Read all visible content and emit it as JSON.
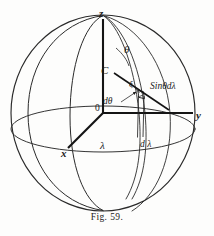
{
  "figure": {
    "caption_prefix": "F",
    "caption_smallcaps": "IG.",
    "caption_number": "59.",
    "caption_full": "Fig. 59.",
    "ink_color": "#1b1b1b",
    "background_color": "#fdfdfc"
  },
  "labels": {
    "axis_z": "z",
    "axis_y": "y",
    "axis_x": "x",
    "origin": "0",
    "point_c": "C",
    "theta": "θ",
    "d_theta": "dθ",
    "xi": "ξ",
    "lambda": "λ",
    "d_lambda": "d λ",
    "sin_theta_d_lambda": "Sinθdλ"
  },
  "geometry": {
    "sphere_center": [
      103,
      113
    ],
    "sphere_radius_x": 92,
    "sphere_radius_y": 98,
    "axis_z_top": [
      103,
      22
    ],
    "axis_y_right": [
      193,
      113
    ],
    "axis_x_front": [
      68,
      153
    ],
    "element_point": [
      141,
      94
    ]
  }
}
